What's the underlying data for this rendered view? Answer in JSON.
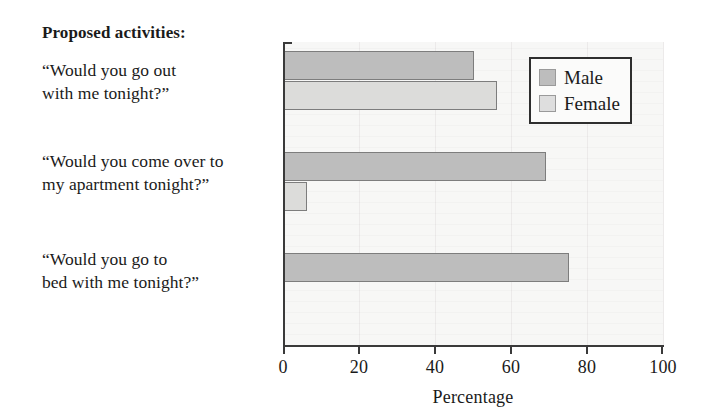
{
  "chart_data": {
    "type": "bar",
    "orientation": "horizontal",
    "title": "Proposed activities:",
    "xlabel": "Percentage",
    "ylabel": "",
    "xlim": [
      0,
      100
    ],
    "xticks": [
      0,
      20,
      40,
      60,
      80,
      100
    ],
    "xticklabels": [
      "0",
      "20",
      "40",
      "60",
      "80",
      "100"
    ],
    "grid": "vertical-faint",
    "legend_position": "upper right",
    "categories": [
      "“Would you go out with me tonight?”",
      "“Would you come over to my apartment tonight?”",
      "“Would you go to bed with me tonight?”"
    ],
    "category_lines": [
      [
        "“Would you go out",
        "with me tonight?”"
      ],
      [
        "“Would you come over to",
        "my apartment tonight?”"
      ],
      [
        "“Would you go to",
        "bed with me tonight?”"
      ]
    ],
    "series": [
      {
        "name": "Male",
        "color": "#bdbdbd",
        "values": [
          50,
          69,
          75
        ]
      },
      {
        "name": "Female",
        "color": "#dcdcda",
        "values": [
          56,
          6,
          0
        ]
      }
    ]
  },
  "legend": {
    "items": [
      {
        "label": "Male"
      },
      {
        "label": "Female"
      }
    ]
  },
  "axis": {
    "x_label": "Percentage"
  }
}
